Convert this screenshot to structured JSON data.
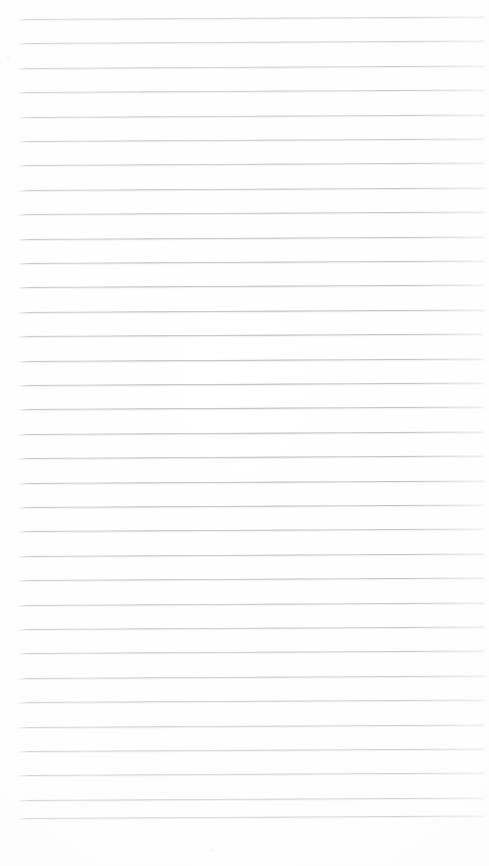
{
  "document": {
    "kind": "scanned-page",
    "title": "Blank ruled notebook page",
    "page_width": 489,
    "page_height": 866,
    "background_color": "#ffffff",
    "has_text": false,
    "visible_text": ""
  },
  "ruling": {
    "line_color": "#969ba2",
    "line_count": 34,
    "first_line_y": 19,
    "line_spacing": 24.4,
    "line_start_x": 19,
    "line_end_x": 484,
    "line_thickness": 1,
    "skew_degrees": -0.3,
    "margin_left": 19,
    "margin_right": 5,
    "margin_top": 19,
    "margin_bottom": 48
  },
  "lines": [
    {
      "index": 1,
      "y": 19.0,
      "label": "rule-line-1"
    },
    {
      "index": 2,
      "y": 43.4,
      "label": "rule-line-2"
    },
    {
      "index": 3,
      "y": 67.8,
      "label": "rule-line-3"
    },
    {
      "index": 4,
      "y": 92.2,
      "label": "rule-line-4"
    },
    {
      "index": 5,
      "y": 116.6,
      "label": "rule-line-5"
    },
    {
      "index": 6,
      "y": 141.0,
      "label": "rule-line-6"
    },
    {
      "index": 7,
      "y": 165.4,
      "label": "rule-line-7"
    },
    {
      "index": 8,
      "y": 189.8,
      "label": "rule-line-8"
    },
    {
      "index": 9,
      "y": 214.2,
      "label": "rule-line-9"
    },
    {
      "index": 10,
      "y": 238.6,
      "label": "rule-line-10"
    },
    {
      "index": 11,
      "y": 263.0,
      "label": "rule-line-11"
    },
    {
      "index": 12,
      "y": 287.4,
      "label": "rule-line-12"
    },
    {
      "index": 13,
      "y": 311.8,
      "label": "rule-line-13"
    },
    {
      "index": 14,
      "y": 336.2,
      "label": "rule-line-14"
    },
    {
      "index": 15,
      "y": 360.6,
      "label": "rule-line-15"
    },
    {
      "index": 16,
      "y": 385.0,
      "label": "rule-line-16"
    },
    {
      "index": 17,
      "y": 409.4,
      "label": "rule-line-17"
    },
    {
      "index": 18,
      "y": 433.8,
      "label": "rule-line-18"
    },
    {
      "index": 19,
      "y": 458.2,
      "label": "rule-line-19"
    },
    {
      "index": 20,
      "y": 482.6,
      "label": "rule-line-20"
    },
    {
      "index": 21,
      "y": 507.0,
      "label": "rule-line-21"
    },
    {
      "index": 22,
      "y": 531.4,
      "label": "rule-line-22"
    },
    {
      "index": 23,
      "y": 555.8,
      "label": "rule-line-23"
    },
    {
      "index": 24,
      "y": 580.2,
      "label": "rule-line-24"
    },
    {
      "index": 25,
      "y": 604.6,
      "label": "rule-line-25"
    },
    {
      "index": 26,
      "y": 629.0,
      "label": "rule-line-26"
    },
    {
      "index": 27,
      "y": 653.4,
      "label": "rule-line-27"
    },
    {
      "index": 28,
      "y": 677.8,
      "label": "rule-line-28"
    },
    {
      "index": 29,
      "y": 702.2,
      "label": "rule-line-29"
    },
    {
      "index": 30,
      "y": 726.6,
      "label": "rule-line-30"
    },
    {
      "index": 31,
      "y": 751.0,
      "label": "rule-line-31"
    },
    {
      "index": 32,
      "y": 775.4,
      "label": "rule-line-32"
    },
    {
      "index": 33,
      "y": 799.8,
      "label": "rule-line-33"
    },
    {
      "index": 34,
      "y": 818.0,
      "label": "rule-line-34"
    }
  ],
  "specks": [
    {
      "x": 7,
      "y": 57,
      "size": 2
    },
    {
      "x": 141,
      "y": 92,
      "size": 2
    },
    {
      "x": 211,
      "y": 849,
      "size": 2
    },
    {
      "x": 155,
      "y": 89,
      "size": 1
    }
  ]
}
